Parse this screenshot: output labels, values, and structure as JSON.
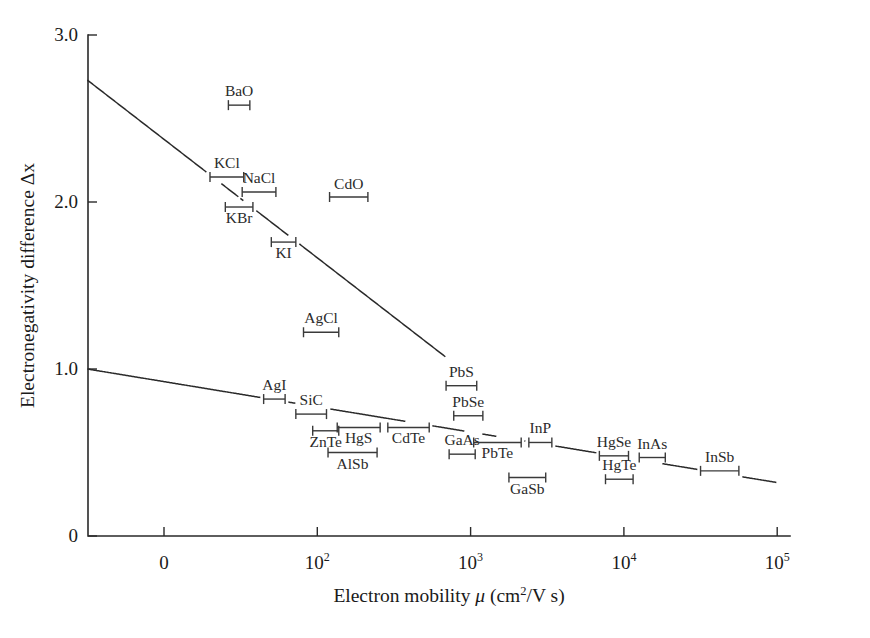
{
  "chart_data": {
    "type": "scatter",
    "title": "",
    "xlabel": "Electron mobility μ (cm²/V s)",
    "ylabel": "Electronegativity difference Δx",
    "x_scale": "log",
    "x_tick_labels": [
      "0",
      "10²",
      "10³",
      "10⁴",
      "10⁵"
    ],
    "x_tick_bases": [
      "0",
      "10",
      "10",
      "10",
      "10"
    ],
    "x_tick_exponents": [
      "",
      "2",
      "3",
      "4",
      "5"
    ],
    "x_tick_decades": [
      1,
      2,
      3,
      4,
      5
    ],
    "y_tick_labels": [
      "0",
      "1.0",
      "2.0",
      "3.0"
    ],
    "y_tick_values": [
      0,
      1.0,
      2.0,
      3.0
    ],
    "ylim": [
      0,
      3.0
    ],
    "grid": false,
    "legend": "none",
    "points": [
      {
        "label": "BaO",
        "y": 2.58,
        "x_lo_decade": 1.42,
        "x_hi_decade": 1.56,
        "label_dx": 0,
        "label_dy": -9
      },
      {
        "label": "KCl",
        "y": 2.15,
        "x_lo_decade": 1.3,
        "x_hi_decade": 1.52,
        "label_dx": 0,
        "label_dy": -9
      },
      {
        "label": "NaCl",
        "y": 2.06,
        "x_lo_decade": 1.51,
        "x_hi_decade": 1.73,
        "label_dx": 0,
        "label_dy": -9
      },
      {
        "label": "KBr",
        "y": 1.97,
        "x_lo_decade": 1.4,
        "x_hi_decade": 1.58,
        "label_dx": 0,
        "label_dy": 16
      },
      {
        "label": "KI",
        "y": 1.76,
        "x_lo_decade": 1.7,
        "x_hi_decade": 1.86,
        "label_dx": 0,
        "label_dy": 16
      },
      {
        "label": "CdO",
        "y": 2.03,
        "x_lo_decade": 2.08,
        "x_hi_decade": 2.33,
        "label_dx": 0,
        "label_dy": -8
      },
      {
        "label": "AgCl",
        "y": 1.22,
        "x_lo_decade": 1.91,
        "x_hi_decade": 2.14,
        "label_dx": 0,
        "label_dy": -9
      },
      {
        "label": "PbS",
        "y": 0.9,
        "x_lo_decade": 2.84,
        "x_hi_decade": 3.04,
        "label_dx": 0,
        "label_dy": -9
      },
      {
        "label": "AgI",
        "y": 0.82,
        "x_lo_decade": 1.65,
        "x_hi_decade": 1.79,
        "label_dx": 0,
        "label_dy": -9
      },
      {
        "label": "SiC",
        "y": 0.73,
        "x_lo_decade": 1.86,
        "x_hi_decade": 2.06,
        "label_dx": 0,
        "label_dy": -9
      },
      {
        "label": "ZnTe",
        "y": 0.63,
        "x_lo_decade": 1.97,
        "x_hi_decade": 2.14,
        "label_dx": 0,
        "label_dy": 16
      },
      {
        "label": "HgS",
        "y": 0.65,
        "x_lo_decade": 2.13,
        "x_hi_decade": 2.41,
        "label_dx": 0,
        "label_dy": 16
      },
      {
        "label": "CdTe",
        "y": 0.65,
        "x_lo_decade": 2.46,
        "x_hi_decade": 2.73,
        "label_dx": 0,
        "label_dy": 16
      },
      {
        "label": "AlSb",
        "y": 0.5,
        "x_lo_decade": 2.07,
        "x_hi_decade": 2.39,
        "label_dx": 0,
        "label_dy": 16
      },
      {
        "label": "PbSe",
        "y": 0.72,
        "x_lo_decade": 2.89,
        "x_hi_decade": 3.08,
        "label_dx": 0,
        "label_dy": -9
      },
      {
        "label": "GaAs",
        "y": 0.49,
        "x_lo_decade": 2.86,
        "x_hi_decade": 3.03,
        "label_dx": 0,
        "label_dy": -9
      },
      {
        "label": "PbTe",
        "y": 0.56,
        "x_lo_decade": 3.02,
        "x_hi_decade": 3.33,
        "label_dx": 0,
        "label_dy": 16
      },
      {
        "label": "InP",
        "y": 0.56,
        "x_lo_decade": 3.38,
        "x_hi_decade": 3.53,
        "label_dx": 0,
        "label_dy": -9
      },
      {
        "label": "GaSb",
        "y": 0.35,
        "x_lo_decade": 3.25,
        "x_hi_decade": 3.49,
        "label_dx": 0,
        "label_dy": 16
      },
      {
        "label": "HgSe",
        "y": 0.48,
        "x_lo_decade": 3.84,
        "x_hi_decade": 4.03,
        "label_dx": 0,
        "label_dy": -9
      },
      {
        "label": "HgTe",
        "y": 0.34,
        "x_lo_decade": 3.88,
        "x_hi_decade": 4.06,
        "label_dx": 0,
        "label_dy": -9
      },
      {
        "label": "InAs",
        "y": 0.47,
        "x_lo_decade": 4.1,
        "x_hi_decade": 4.27,
        "label_dx": 0,
        "label_dy": -9
      },
      {
        "label": "InSb",
        "y": 0.39,
        "x_lo_decade": 4.5,
        "x_hi_decade": 4.75,
        "label_dx": 0,
        "label_dy": -9
      }
    ],
    "trend_lines": [
      {
        "name": "ionic-compounds-trend",
        "x0_decade": 0.5,
        "y0": 2.73,
        "x1_decade": 2.84,
        "y1": 1.07
      },
      {
        "name": "covalent-compounds-trend",
        "x0_decade": 0.5,
        "y0": 1.0,
        "x1_decade": 5.0,
        "y1": 0.32
      }
    ]
  },
  "axes": {
    "y_axis_title": "Electronegativity difference Δx",
    "x_axis_title_parts": {
      "pre": "Electron mobility ",
      "mu": "μ",
      "open": " (cm",
      "sup": "2",
      "post": "/V s)"
    }
  }
}
